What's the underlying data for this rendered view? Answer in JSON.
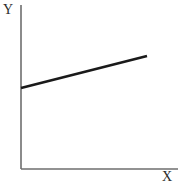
{
  "figure": {
    "width": 181,
    "height": 192,
    "background": "#ffffff"
  },
  "chart_data": {
    "type": "line",
    "title": "",
    "subtitle": "",
    "xlabel": "X",
    "ylabel": "Y",
    "series": [
      {
        "name": "trend",
        "x": [
          0,
          1
        ],
        "values": [
          0.52,
          0.72
        ],
        "color": "#1a1a1a",
        "line_width": 2.6,
        "markers": false
      }
    ],
    "x_tick_labels": [],
    "y_tick_labels": [],
    "xlim": [
      0,
      1
    ],
    "ylim": [
      0,
      1
    ],
    "grid": false,
    "legend": null,
    "annotations": []
  },
  "axes": {
    "y_axis": {
      "label": "Y",
      "color": "#6e6e6e",
      "line_width": 1.6,
      "x": 21,
      "y_top": 5,
      "y_bottom": 169
    },
    "x_axis": {
      "label": "X",
      "color": "#6e6e6e",
      "line_width": 1.6,
      "y": 169,
      "x_left": 21,
      "x_right": 178
    }
  },
  "trend_line": {
    "color": "#1a1a1a",
    "x1": 21,
    "y1": 88,
    "x2": 147,
    "y2": 56,
    "stroke_width": 2.6
  }
}
